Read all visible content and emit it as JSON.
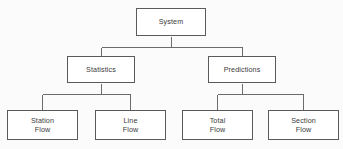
{
  "diagram": {
    "type": "hierarchy-tree",
    "orientation": "top-down",
    "levels": 3,
    "style": {
      "box_fill": "#ffffff",
      "box_border": "#5a5a5a",
      "connector_color": "#6b6b6b",
      "text_color": "#3b3b3b",
      "background": "#fbfbfb"
    },
    "root": {
      "label": "System"
    },
    "level2": [
      {
        "label": "Statistics"
      },
      {
        "label": "Predictions"
      }
    ],
    "level3": [
      {
        "line1": "Station",
        "line2": "Flow"
      },
      {
        "line1": "Line",
        "line2": "Flow"
      },
      {
        "line1": "Total",
        "line2": "Flow"
      },
      {
        "line1": "Section",
        "line2": "Flow"
      }
    ],
    "edges": [
      {
        "from": "System",
        "to": "Statistics"
      },
      {
        "from": "System",
        "to": "Predictions"
      },
      {
        "from": "Statistics",
        "to": "Station Flow"
      },
      {
        "from": "Statistics",
        "to": "Line Flow"
      },
      {
        "from": "Predictions",
        "to": "Total Flow"
      },
      {
        "from": "Predictions",
        "to": "Section Flow"
      }
    ]
  }
}
